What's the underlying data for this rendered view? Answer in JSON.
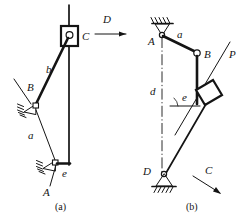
{
  "figure": {
    "type": "mechanism-kinematic-diagram",
    "panels": [
      {
        "id": "a",
        "caption": "(a)",
        "labels": [
          {
            "key": "C",
            "text": "C",
            "role": "slider-joint-label"
          },
          {
            "key": "D",
            "text": "D",
            "role": "force-arrow-label"
          },
          {
            "key": "b",
            "text": "b",
            "role": "link-label"
          },
          {
            "key": "B",
            "text": "B",
            "role": "pivot-label"
          },
          {
            "key": "a",
            "text": "a",
            "role": "link-label"
          },
          {
            "key": "A",
            "text": "A",
            "role": "pivot-label"
          },
          {
            "key": "e",
            "text": "e",
            "role": "link-label"
          }
        ],
        "elements": [
          {
            "name": "slider-block-c",
            "type": "slider"
          },
          {
            "name": "guide-rail-vertical",
            "type": "rail"
          },
          {
            "name": "force-arrow-d",
            "type": "arrow",
            "direction": "right"
          },
          {
            "name": "link-b",
            "type": "link"
          },
          {
            "name": "fixed-pivot-b",
            "type": "ground-pivot"
          },
          {
            "name": "fixed-pivot-a",
            "type": "ground-pivot"
          },
          {
            "name": "link-e",
            "type": "link"
          }
        ]
      },
      {
        "id": "b",
        "caption": "(b)",
        "labels": [
          {
            "key": "A",
            "text": "A",
            "role": "pivot-label"
          },
          {
            "key": "a",
            "text": "a",
            "role": "link-label"
          },
          {
            "key": "B",
            "text": "B",
            "role": "pivot-label"
          },
          {
            "key": "P",
            "text": "P",
            "role": "force-label"
          },
          {
            "key": "d",
            "text": "d",
            "role": "link-label"
          },
          {
            "key": "e",
            "text": "e",
            "role": "link-label"
          },
          {
            "key": "D",
            "text": "D",
            "role": "pivot-label"
          },
          {
            "key": "C",
            "text": "C",
            "role": "force-arrow-label"
          }
        ],
        "elements": [
          {
            "name": "ground-support-a",
            "type": "ground-hatch-pivot"
          },
          {
            "name": "link-a",
            "type": "link"
          },
          {
            "name": "pin-joint-b",
            "type": "pin"
          },
          {
            "name": "slider-block-p",
            "type": "slider"
          },
          {
            "name": "guide-line-p",
            "type": "rail"
          },
          {
            "name": "link-d",
            "type": "link"
          },
          {
            "name": "centerline-vertical",
            "type": "centerline"
          },
          {
            "name": "ground-support-d",
            "type": "ground-hatch-pivot"
          },
          {
            "name": "force-arrow-c",
            "type": "arrow",
            "direction": "down-right"
          }
        ]
      }
    ],
    "colors": {
      "ink": "#141414",
      "background": "#ffffff"
    }
  }
}
